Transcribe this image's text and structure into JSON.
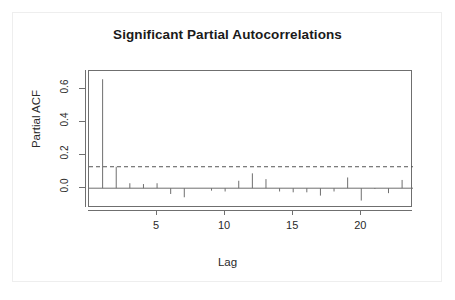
{
  "chart_data": {
    "type": "bar",
    "title": "Significant Partial Autocorrelations",
    "xlabel": "Lag",
    "ylabel": "Partial ACF",
    "categories": [
      1,
      2,
      3,
      4,
      5,
      6,
      7,
      8,
      9,
      10,
      11,
      12,
      13,
      14,
      15,
      16,
      17,
      18,
      19,
      20,
      21,
      22,
      23
    ],
    "values": [
      0.66,
      0.13,
      0.03,
      0.025,
      0.03,
      -0.035,
      -0.055,
      0.0,
      -0.015,
      -0.02,
      0.045,
      0.09,
      0.055,
      -0.02,
      -0.025,
      -0.025,
      -0.045,
      -0.02,
      0.065,
      -0.075,
      -0.005,
      -0.03,
      0.05
    ],
    "xlim": [
      0,
      23.8
    ],
    "ylim": [
      -0.12,
      0.71
    ],
    "xticks": [
      5,
      10,
      15,
      20
    ],
    "xtick_labels": [
      "5",
      "10",
      "15",
      "20"
    ],
    "yticks": [
      0.0,
      0.2,
      0.4,
      0.6
    ],
    "ytick_labels": [
      "0.0",
      "0.2",
      "0.4",
      "0.6"
    ],
    "confidence_bounds": {
      "upper": 0.13,
      "lower": -0.13,
      "style": "dashed",
      "color": "#555555"
    },
    "grid": false,
    "legend": null,
    "baseline": 0.0,
    "series_color": "#6f6f6f",
    "axis_color": "#6f6f6f"
  }
}
